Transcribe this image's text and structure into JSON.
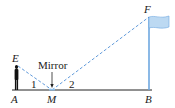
{
  "diagram": {
    "points": {
      "A": {
        "label": "A",
        "x": 15,
        "y": 90
      },
      "M": {
        "label": "M",
        "x": 52,
        "y": 90
      },
      "B": {
        "label": "B",
        "x": 149,
        "y": 90
      },
      "E": {
        "label": "E",
        "x": 17,
        "y": 66
      },
      "F": {
        "label": "F",
        "x": 149,
        "y": 17
      }
    },
    "angles": {
      "angle1": "1",
      "angle2": "2"
    },
    "annotations": {
      "mirror": "Mirror"
    },
    "colors": {
      "line": "#222222",
      "dashed": "#4f8fd6",
      "flag": "#bcd9f2",
      "pole": "#6fa8e0"
    }
  }
}
